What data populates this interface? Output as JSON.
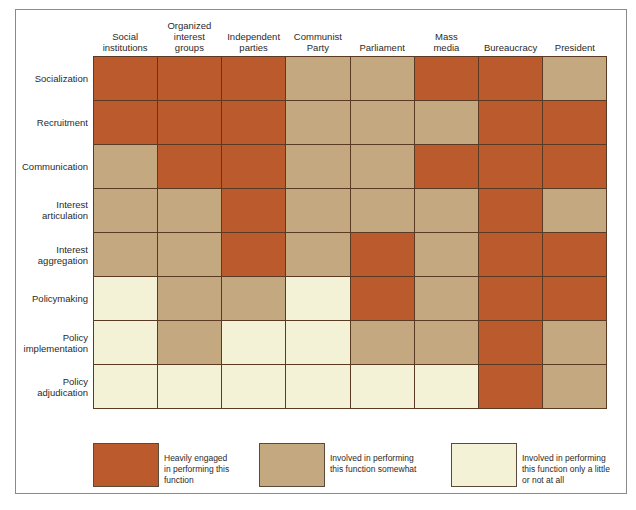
{
  "figure": {
    "columns": [
      "Social\ninstitutions",
      "Organized\ninterest\ngroups",
      "Independent\nparties",
      "Communist\nParty",
      "Parliament",
      "Mass\nmedia",
      "Bureaucracy",
      "President"
    ],
    "rows": [
      "Socialization",
      "Recruitment",
      "Communication",
      "Interest\narticulation",
      "Interest\naggregation",
      "Policymaking",
      "Policy\nimplementation",
      "Policy\nadjudication"
    ],
    "cells": [
      [
        "H",
        "H",
        "H",
        "S",
        "S",
        "H",
        "H",
        "S"
      ],
      [
        "H",
        "H",
        "H",
        "S",
        "S",
        "S",
        "H",
        "H"
      ],
      [
        "S",
        "H",
        "H",
        "S",
        "S",
        "H",
        "H",
        "H"
      ],
      [
        "S",
        "S",
        "H",
        "S",
        "S",
        "S",
        "H",
        "S"
      ],
      [
        "S",
        "S",
        "H",
        "S",
        "H",
        "S",
        "H",
        "H"
      ],
      [
        "L",
        "S",
        "S",
        "L",
        "H",
        "S",
        "H",
        "H"
      ],
      [
        "L",
        "S",
        "L",
        "L",
        "S",
        "S",
        "H",
        "S"
      ],
      [
        "L",
        "L",
        "L",
        "L",
        "L",
        "L",
        "H",
        "S"
      ]
    ],
    "legend": [
      {
        "key": "H",
        "label": "Heavily engaged\nin performing this\nfunction",
        "color": "#bb5a2c"
      },
      {
        "key": "S",
        "label": "Involved in performing\nthis function somewhat",
        "color": "#c4a880"
      },
      {
        "key": "L",
        "label": "Involved in performing\nthis function only a little\nor not at all",
        "color": "#f3f2d6"
      }
    ],
    "colors": {
      "heavy": "#bb5a2c",
      "somewhat": "#c4a880",
      "little": "#f3f2d6",
      "gridline": "#5a3a22"
    }
  }
}
